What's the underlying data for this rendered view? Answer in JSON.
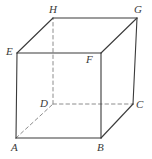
{
  "figure": {
    "type": "geometry-diagram",
    "shape_name": "cube",
    "stroke_color": "#3a3a3a",
    "hidden_edge_color": "#8c8c8c",
    "background_color": "#ffffff",
    "vertices": [
      {
        "label": "A",
        "x": 16,
        "y": 138,
        "label_x": 11,
        "label_y": 142
      },
      {
        "label": "B",
        "x": 101,
        "y": 138,
        "label_x": 97,
        "label_y": 142
      },
      {
        "label": "C",
        "x": 133,
        "y": 104,
        "label_x": 136,
        "label_y": 99
      },
      {
        "label": "D",
        "x": 53,
        "y": 104,
        "label_x": 40,
        "label_y": 98
      },
      {
        "label": "E",
        "x": 17,
        "y": 53,
        "label_x": 6,
        "label_y": 46
      },
      {
        "label": "F",
        "x": 101,
        "y": 53,
        "label_x": 86,
        "label_y": 54
      },
      {
        "label": "G",
        "x": 137,
        "y": 18,
        "label_x": 134,
        "label_y": 4
      },
      {
        "label": "H",
        "x": 53,
        "y": 18,
        "label_x": 49,
        "label_y": 4
      }
    ],
    "edges": [
      {
        "name": "edge-A-B",
        "from": "A",
        "to": "B",
        "hidden": false
      },
      {
        "name": "edge-B-C",
        "from": "B",
        "to": "C",
        "hidden": false
      },
      {
        "name": "edge-A-E",
        "from": "A",
        "to": "E",
        "hidden": false
      },
      {
        "name": "edge-B-F",
        "from": "B",
        "to": "F",
        "hidden": false
      },
      {
        "name": "edge-C-G",
        "from": "C",
        "to": "G",
        "hidden": false
      },
      {
        "name": "edge-E-F",
        "from": "E",
        "to": "F",
        "hidden": false
      },
      {
        "name": "edge-E-H",
        "from": "E",
        "to": "H",
        "hidden": false
      },
      {
        "name": "edge-F-G",
        "from": "F",
        "to": "G",
        "hidden": false
      },
      {
        "name": "edge-H-G",
        "from": "H",
        "to": "G",
        "hidden": false
      },
      {
        "name": "edge-A-D",
        "from": "A",
        "to": "D",
        "hidden": true
      },
      {
        "name": "edge-D-C",
        "from": "D",
        "to": "C",
        "hidden": true
      },
      {
        "name": "edge-D-H",
        "from": "D",
        "to": "H",
        "hidden": true
      }
    ]
  }
}
